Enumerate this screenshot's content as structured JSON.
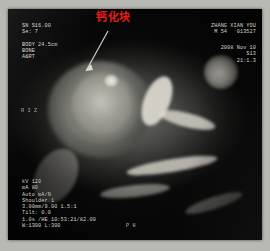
{
  "modality": "CT",
  "annotation": {
    "label": "钙化块",
    "color": "#e0211c",
    "points_to": "calcified-mass"
  },
  "overlay": {
    "top_left": [
      "SN S16.00",
      "Se: 7",
      "",
      "BODY 24.5cm",
      "BONE",
      "A&RT"
    ],
    "top_right_patient": [
      "ZHANG XIAN YOU",
      "M 54   013527"
    ],
    "top_right_study": [
      "2008 Nov 10",
      "S13",
      "21:1.3"
    ],
    "bottom_left": [
      "kV 120",
      "mA 80",
      "Auto mA/N",
      "Shoulder 1",
      "3.00mm/9.00 1.5:1",
      "Tilt: 0.0",
      "1.0s /HE 10:53:21/82.00",
      "W:1300 L:300"
    ],
    "bottom_center": "P H",
    "orientation_letters": [
      "R",
      "I",
      "Z"
    ]
  },
  "window": {
    "width_label": "W:1300",
    "level_label": "L:300"
  }
}
